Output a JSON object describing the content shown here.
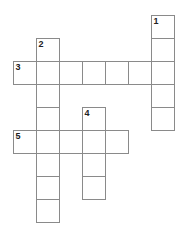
{
  "puzzle": {
    "title": "Crossword Grid",
    "grid": {
      "origin_x": 13,
      "origin_y": 15,
      "cell_size": 23,
      "border_color": "#8a8a8a",
      "cell_fill": "#ffffff",
      "background": "#ffffff"
    },
    "entries": [
      {
        "number": "1",
        "direction": "down",
        "row": 0,
        "col": 6,
        "length": 5
      },
      {
        "number": "2",
        "direction": "down",
        "row": 1,
        "col": 1,
        "length": 8
      },
      {
        "number": "3",
        "direction": "across",
        "row": 2,
        "col": 0,
        "length": 7
      },
      {
        "number": "4",
        "direction": "down",
        "row": 4,
        "col": 3,
        "length": 4
      },
      {
        "number": "5",
        "direction": "across",
        "row": 5,
        "col": 0,
        "length": 5
      }
    ],
    "cells": [
      {
        "row": 0,
        "col": 6,
        "number": "1",
        "letter": ""
      },
      {
        "row": 1,
        "col": 1,
        "number": "2",
        "letter": ""
      },
      {
        "row": 1,
        "col": 6,
        "number": "",
        "letter": ""
      },
      {
        "row": 2,
        "col": 0,
        "number": "3",
        "letter": ""
      },
      {
        "row": 2,
        "col": 1,
        "number": "",
        "letter": ""
      },
      {
        "row": 2,
        "col": 2,
        "number": "",
        "letter": ""
      },
      {
        "row": 2,
        "col": 3,
        "number": "",
        "letter": ""
      },
      {
        "row": 2,
        "col": 4,
        "number": "",
        "letter": ""
      },
      {
        "row": 2,
        "col": 5,
        "number": "",
        "letter": ""
      },
      {
        "row": 2,
        "col": 6,
        "number": "",
        "letter": ""
      },
      {
        "row": 3,
        "col": 1,
        "number": "",
        "letter": ""
      },
      {
        "row": 3,
        "col": 6,
        "number": "",
        "letter": ""
      },
      {
        "row": 4,
        "col": 1,
        "number": "",
        "letter": ""
      },
      {
        "row": 4,
        "col": 3,
        "number": "4",
        "letter": ""
      },
      {
        "row": 4,
        "col": 6,
        "number": "",
        "letter": ""
      },
      {
        "row": 5,
        "col": 0,
        "number": "5",
        "letter": ""
      },
      {
        "row": 5,
        "col": 1,
        "number": "",
        "letter": ""
      },
      {
        "row": 5,
        "col": 2,
        "number": "",
        "letter": ""
      },
      {
        "row": 5,
        "col": 3,
        "number": "",
        "letter": ""
      },
      {
        "row": 5,
        "col": 4,
        "number": "",
        "letter": ""
      },
      {
        "row": 6,
        "col": 1,
        "number": "",
        "letter": ""
      },
      {
        "row": 6,
        "col": 3,
        "number": "",
        "letter": ""
      },
      {
        "row": 7,
        "col": 1,
        "number": "",
        "letter": ""
      },
      {
        "row": 7,
        "col": 3,
        "number": "",
        "letter": ""
      },
      {
        "row": 8,
        "col": 1,
        "number": "",
        "letter": ""
      }
    ]
  }
}
